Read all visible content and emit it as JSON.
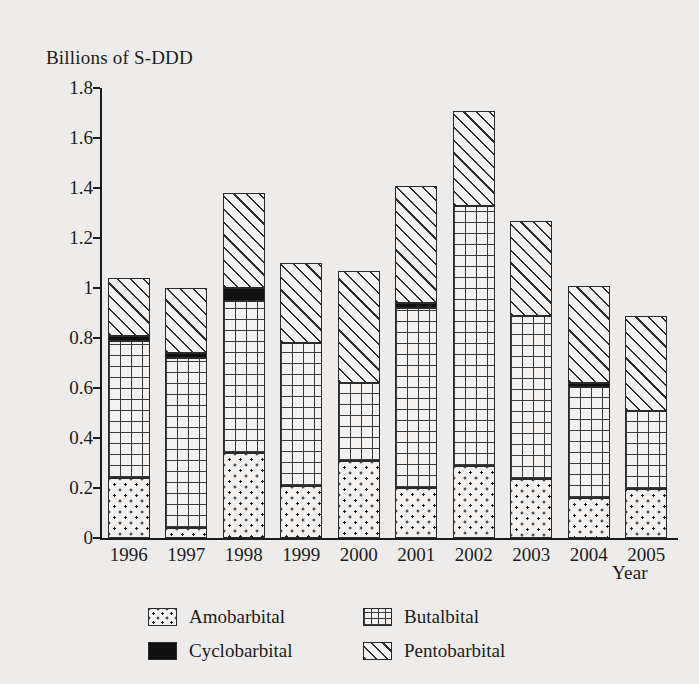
{
  "chart_data": {
    "type": "bar",
    "subtype": "stacked-bar",
    "title": "",
    "xlabel": "Year",
    "ylabel": "Billions of S-DDD",
    "ylim": [
      0,
      1.8
    ],
    "ytick_step": 0.2,
    "grid": false,
    "legend_position": "bottom",
    "categories": [
      "1996",
      "1997",
      "1998",
      "1999",
      "2000",
      "2001",
      "2002",
      "2003",
      "2004",
      "2005"
    ],
    "ytick_labels": [
      "0",
      "0.2",
      "0.4",
      "0.6",
      "0.8",
      "1",
      "1.2",
      "1.4",
      "1.6",
      "1.8"
    ],
    "series": [
      {
        "name": "Amobarbital",
        "pattern": "dotted",
        "values": [
          0.24,
          0.04,
          0.34,
          0.21,
          0.31,
          0.2,
          0.29,
          0.235,
          0.16,
          0.195
        ]
      },
      {
        "name": "Butalbital",
        "pattern": "grid",
        "values": [
          0.55,
          0.68,
          0.61,
          0.57,
          0.31,
          0.72,
          1.04,
          0.655,
          0.445,
          0.315
        ]
      },
      {
        "name": "Cyclobarbital",
        "pattern": "solid",
        "values": [
          0.02,
          0.02,
          0.05,
          0.0,
          0.0,
          0.02,
          0.0,
          0.0,
          0.015,
          0.0
        ]
      },
      {
        "name": "Pentobarbital",
        "pattern": "diagonal",
        "values": [
          0.23,
          0.26,
          0.38,
          0.32,
          0.45,
          0.47,
          0.38,
          0.38,
          0.39,
          0.38
        ]
      }
    ],
    "totals": [
      1.04,
      1.0,
      1.38,
      1.1,
      1.07,
      1.41,
      1.71,
      1.27,
      1.01,
      0.89
    ]
  },
  "legend": {
    "items": [
      {
        "label": "Amobarbital",
        "pattern": "dotted"
      },
      {
        "label": "Butalbital",
        "pattern": "grid"
      },
      {
        "label": "Cyclobarbital",
        "pattern": "solid"
      },
      {
        "label": "Pentobarbital",
        "pattern": "diagonal"
      }
    ]
  },
  "colors": {
    "background": "#edecea",
    "ink": "#1c1c1c",
    "bar_fill": "#f2f1ef",
    "bar_stroke": "#2a2a2a",
    "cyclobarbital": "#101010"
  }
}
